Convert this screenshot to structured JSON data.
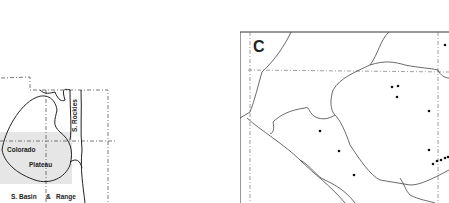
{
  "left_map": {
    "regions": [
      "Colorado",
      "Plateau",
      "S. Rockies",
      "S. Basin",
      "&",
      "Range"
    ],
    "shaded_band_color": "#e6e6e6"
  },
  "right_map": {
    "panel_label": "C",
    "points": [
      [
        445,
        45
      ],
      [
        392,
        87
      ],
      [
        398,
        86
      ],
      [
        397,
        97
      ],
      [
        429,
        111
      ],
      [
        320,
        131
      ],
      [
        339,
        151
      ],
      [
        429,
        150
      ],
      [
        437,
        161
      ],
      [
        441,
        160
      ],
      [
        445,
        158
      ],
      [
        448,
        157
      ],
      [
        433,
        164
      ],
      [
        354,
        175
      ]
    ]
  },
  "colors": {
    "line": "#333333",
    "shade": "#e6e6e6",
    "point": "#111111"
  }
}
